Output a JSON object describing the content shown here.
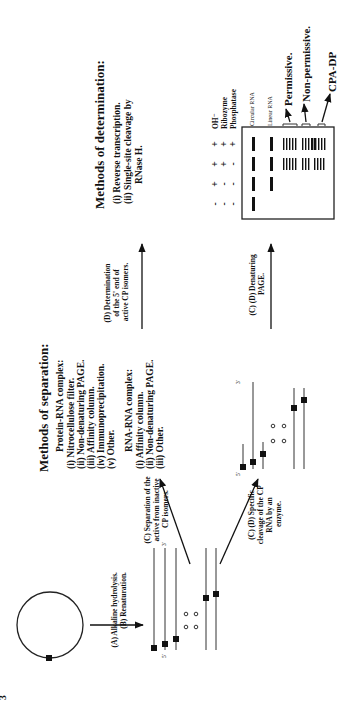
{
  "figure": {
    "orientation": "rotated-90-ccw",
    "background": "#ffffff",
    "ink_color": "#111111"
  },
  "page_mark": "3",
  "steps": {
    "a_b": "(A) Alkaline hydrolysis.",
    "a_b_2": "(B) Renaturation.",
    "c_separation": [
      "(C) Separation of the",
      "active from inactive",
      "CP isomers."
    ],
    "cd_cleavage": [
      "(C) (D) Specific",
      "cleavage of the CP",
      "RNA by an",
      "enzyme."
    ],
    "cd_page": [
      "(C) (D) Denaturing",
      "PAGE."
    ],
    "d_determination": [
      "(D) Determination",
      "of the 5' end of",
      "active CP isomers."
    ]
  },
  "strand_labels": {
    "five_prime": "5'",
    "three_prime": "3'"
  },
  "separation": {
    "title": "Methods of separation:",
    "protein_rna": {
      "heading": "Protein-RNA complex:",
      "items": [
        "(i) Nitrocellulose filter.",
        "(ii) Non-denaturing PAGE.",
        "(iii) Affinity column.",
        "(iv) Immunoprecipitation.",
        "(v) Other."
      ]
    },
    "rna_rna": {
      "heading": "RNA-RNA complex:",
      "items": [
        "(i) Affinity column.",
        "(ii) Non-denaturing PAGE.",
        "(iii) Other."
      ]
    }
  },
  "determination": {
    "title": "Methods of determination:",
    "items": [
      "(i) Reverse transcription.",
      "(ii) Single-site cleavage by",
      "RNase H."
    ]
  },
  "gel": {
    "conditions": [
      {
        "name": "OH⁻",
        "lanes": [
          "-",
          "+",
          "+",
          "+"
        ]
      },
      {
        "name": "Ribozyme",
        "lanes": [
          "-",
          "-",
          "+",
          "+"
        ]
      },
      {
        "name": "Phosphatase",
        "lanes": [
          "-",
          "-",
          "-",
          "+"
        ]
      }
    ],
    "band_labels": {
      "circular": "Circular RNA",
      "linear": "Linear RNA"
    },
    "product_labels": [
      "Permissive.",
      "Non-permissive.",
      "CPA-DP"
    ]
  }
}
